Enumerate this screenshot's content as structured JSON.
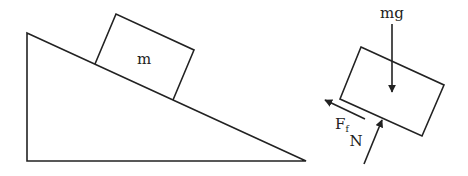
{
  "diagram": {
    "colors": {
      "stroke": "#222222",
      "background": "#ffffff"
    },
    "incline": {
      "points": [
        [
          27,
          33
        ],
        [
          27,
          161
        ],
        [
          306,
          161
        ]
      ]
    },
    "block_on_incline": {
      "label": "m",
      "corners": [
        [
          116,
          14
        ],
        [
          194,
          50
        ],
        [
          173,
          100
        ],
        [
          95,
          64
        ]
      ]
    },
    "free_body": {
      "block_corners": [
        [
          361,
          47
        ],
        [
          444,
          85
        ],
        [
          422,
          136
        ],
        [
          340,
          99
        ]
      ],
      "forces": [
        {
          "name": "weight",
          "label": "mg",
          "from": [
            392,
            22
          ],
          "to": [
            392,
            92
          ]
        },
        {
          "name": "friction",
          "label": "F",
          "subscript": "f",
          "from": [
            365,
            119
          ],
          "to": [
            325,
            100
          ]
        },
        {
          "name": "normal",
          "label": "N",
          "from": [
            364,
            164
          ],
          "to": [
            382,
            119
          ]
        }
      ]
    }
  }
}
